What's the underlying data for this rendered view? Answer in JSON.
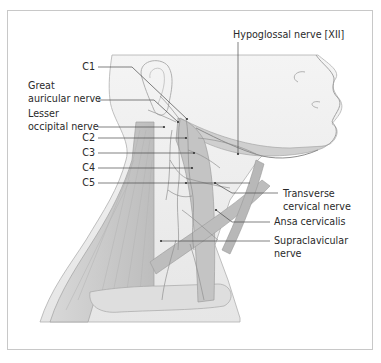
{
  "figure": {
    "colors": {
      "frame_border": "#c8c8c8",
      "background": "#ffffff",
      "skin_fill": "#e9e9e9",
      "muscle_fill": "#c8c8c8",
      "nerve_stroke": "#8a8a8a",
      "leader_line": "#4a4a4a",
      "label_text": "#2a2a2a"
    }
  },
  "labels": {
    "left": [
      {
        "id": "c1",
        "text": "C1"
      },
      {
        "id": "great_auricular_1",
        "text": "Great"
      },
      {
        "id": "great_auricular_2",
        "text": "auricular nerve"
      },
      {
        "id": "lesser_occipital_1",
        "text": "Lesser"
      },
      {
        "id": "lesser_occipital_2",
        "text": "occipital nerve"
      },
      {
        "id": "c2",
        "text": "C2"
      },
      {
        "id": "c3",
        "text": "C3"
      },
      {
        "id": "c4",
        "text": "C4"
      },
      {
        "id": "c5",
        "text": "C5"
      }
    ],
    "top": {
      "text": "Hypoglossal nerve [XII]"
    },
    "right": [
      {
        "id": "transverse_cervical_1",
        "text": "Transverse"
      },
      {
        "id": "transverse_cervical_2",
        "text": "cervical nerve"
      },
      {
        "id": "ansa_cervicalis",
        "text": "Ansa cervicalis"
      },
      {
        "id": "supraclavicular_1",
        "text": "Supraclavicular"
      },
      {
        "id": "supraclavicular_2",
        "text": "nerve"
      }
    ]
  }
}
